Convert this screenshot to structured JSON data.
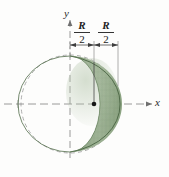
{
  "figure": {
    "title_alt": "Spherical cap (lens-shaped segment) of a sphere shown with x and y axes",
    "axes": {
      "y_label": "y",
      "x_label": "x"
    },
    "dimensions": [
      {
        "numerator": "R",
        "denominator": "2",
        "position": "left-of-y-axis-to-center"
      },
      {
        "numerator": "R",
        "denominator": "2",
        "position": "center-to-right-edge"
      }
    ],
    "colors": {
      "solid_light": "#9bb092",
      "solid_mid": "#8aa280",
      "solid_dark": "#6d8a63",
      "solid_edge": "#4f6a48",
      "dashed_line": "#9a9a9a",
      "axis_line": "#8d8d8d",
      "center_dot": "#1b1b1b",
      "background": "#fdfdfc"
    },
    "geometry": {
      "sphere_center_px": [
        70,
        104
      ],
      "sphere_radius_px": 49,
      "cap_apex_px": [
        120,
        104
      ],
      "cap_flat_face_x_px": 70,
      "center_dot_px": [
        94,
        104
      ],
      "dimension_line_y_px": 45,
      "dimension_span_x_px": [
        70,
        118
      ],
      "dimension_tick_x_px": 94
    }
  }
}
